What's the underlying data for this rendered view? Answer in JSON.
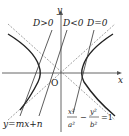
{
  "diagram": {
    "axes": {
      "x_label": "x",
      "y_label": "y",
      "origin_label": "O"
    },
    "conditions": [
      {
        "label": "D>0",
        "meaning": "line intersects hyperbola at two points"
      },
      {
        "label": "D<0",
        "meaning": "line does not intersect hyperbola"
      },
      {
        "label": "D=0",
        "meaning": "line tangent to hyperbola"
      }
    ],
    "line_equation": "y=mx+n",
    "hyperbola_equation": {
      "lhs1_num": "x²",
      "lhs1_den": "a²",
      "minus": "−",
      "lhs2_num": "y²",
      "lhs2_den": "b²",
      "rhs": "=1"
    },
    "colors": {
      "curve": "#222222",
      "axis": "#555555",
      "asymptote": "#666666"
    }
  }
}
